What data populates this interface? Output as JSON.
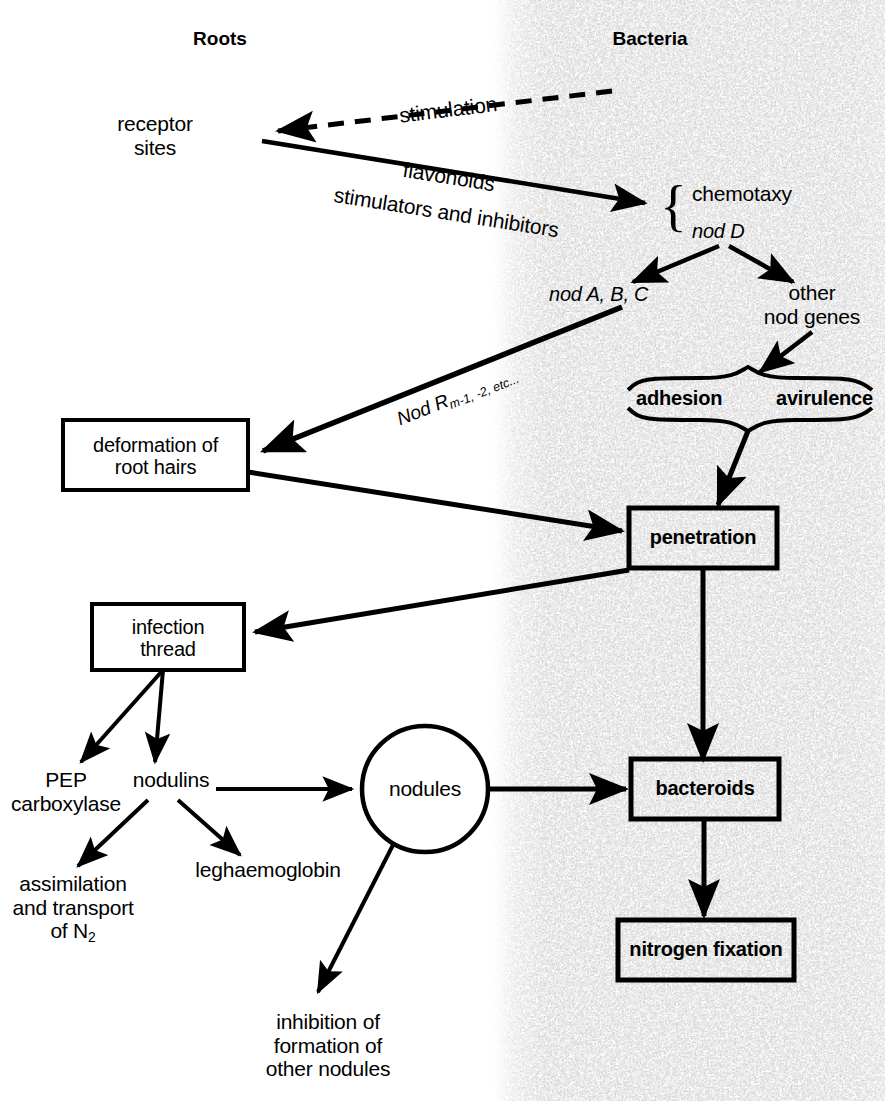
{
  "diagram": {
    "title_left": "Roots",
    "title_right": "Bacteria",
    "type": "flow-diagram"
  },
  "columns": {
    "left_header": "Roots",
    "right_header": "Bacteria"
  },
  "nodes": {
    "receptor_sites": "receptor\nsites",
    "chemotaxy": "chemotaxy",
    "nod_d": "nod D",
    "nod_abc": "nod A, B, C",
    "other_nod_genes": "other\nnod genes",
    "adhesion": "adhesion",
    "avirulence": "avirulence",
    "deformation": "deformation of\nroot hairs",
    "penetration": "penetration",
    "infection_thread": "infection\nthread",
    "pep_carboxylase": "PEP\ncarboxylase",
    "nodulins": "nodulins",
    "leghaemoglobin": "leghaemoglobin",
    "assimilation": "assimilation\nand transport\nof N",
    "assimilation_sub": "2",
    "nodules": "nodules",
    "bacteroids": "bacteroids",
    "nitrogen_fixation": "nitrogen fixation",
    "inhibition": "inhibition of\nformation of\nother nodules"
  },
  "edge_labels": {
    "stimulation": "stimulation",
    "flavonoids": "flavonoids",
    "stimulators_inhibitors": "stimulators and inhibitors",
    "nod_r_main": "Nod R",
    "nod_r_sub": "m-1, -2, etc...",
    "nod_r_full": "Nod Rm-1, -2, etc..."
  },
  "colors": {
    "ink": "#000000",
    "background": "#ffffff",
    "texture": "#9a9a9a"
  }
}
